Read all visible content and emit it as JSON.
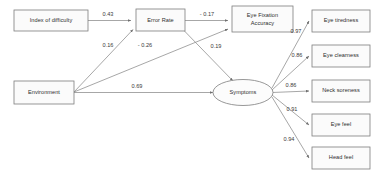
{
  "diagram": {
    "type": "path-diagram",
    "nodes": {
      "index_of_difficulty": {
        "label": "Index of difficulty",
        "shape": "rect",
        "role": "observed-exogenous"
      },
      "environment": {
        "label": "Environment",
        "shape": "rect",
        "role": "observed-exogenous"
      },
      "error_rate": {
        "label": "Error Rate",
        "shape": "rect",
        "role": "observed-mediator"
      },
      "eye_fixation_accuracy_line1": {
        "label": "Eye Fixation",
        "shape": "rect",
        "role": "observed-endogenous"
      },
      "eye_fixation_accuracy_line2": {
        "label": "Accuracy"
      },
      "symptoms": {
        "label": "Symptoms",
        "shape": "ellipse",
        "role": "latent-factor"
      },
      "eye_tiredness": {
        "label": "Eye tiredness",
        "shape": "rect",
        "role": "indicator"
      },
      "eye_clearness": {
        "label": "Eye clearness",
        "shape": "rect",
        "role": "indicator"
      },
      "neck_soreness": {
        "label": "Neck soreness",
        "shape": "rect",
        "role": "indicator"
      },
      "eye_feel": {
        "label": "Eye feel",
        "shape": "rect",
        "role": "indicator"
      },
      "head_feel": {
        "label": "Head feel",
        "shape": "rect",
        "role": "indicator"
      }
    },
    "paths": [
      {
        "id": "id-to-error",
        "from": "index_of_difficulty",
        "to": "error_rate",
        "coefficient": "0.43"
      },
      {
        "id": "error-to-efa",
        "from": "error_rate",
        "to": "eye_fixation_accuracy",
        "coefficient": "- 0.17"
      },
      {
        "id": "env-to-error",
        "from": "environment",
        "to": "error_rate",
        "coefficient": "0.16"
      },
      {
        "id": "env-to-efa",
        "from": "environment",
        "to": "eye_fixation_accuracy",
        "coefficient": "- 0.26"
      },
      {
        "id": "error-to-symptoms",
        "from": "error_rate",
        "to": "symptoms",
        "coefficient": "0.19"
      },
      {
        "id": "env-to-symptoms",
        "from": "environment",
        "to": "symptoms",
        "coefficient": "0.69"
      },
      {
        "id": "symptoms-to-eye-tiredness",
        "from": "symptoms",
        "to": "eye_tiredness",
        "coefficient": "0.97"
      },
      {
        "id": "symptoms-to-eye-clearness",
        "from": "symptoms",
        "to": "eye_clearness",
        "coefficient": "0.86"
      },
      {
        "id": "symptoms-to-neck-soreness",
        "from": "symptoms",
        "to": "neck_soreness",
        "coefficient": "0.86"
      },
      {
        "id": "symptoms-to-eye-feel",
        "from": "symptoms",
        "to": "eye_feel",
        "coefficient": "0.91"
      },
      {
        "id": "symptoms-to-head-feel",
        "from": "symptoms",
        "to": "head_feel",
        "coefficient": "0.94"
      }
    ],
    "colors": {
      "node_fill": "#fbfbfb",
      "node_stroke": "#7d7d7d",
      "path_stroke": "#8a8a8a",
      "text": "#2e2e2e",
      "background": "#ffffff"
    }
  }
}
